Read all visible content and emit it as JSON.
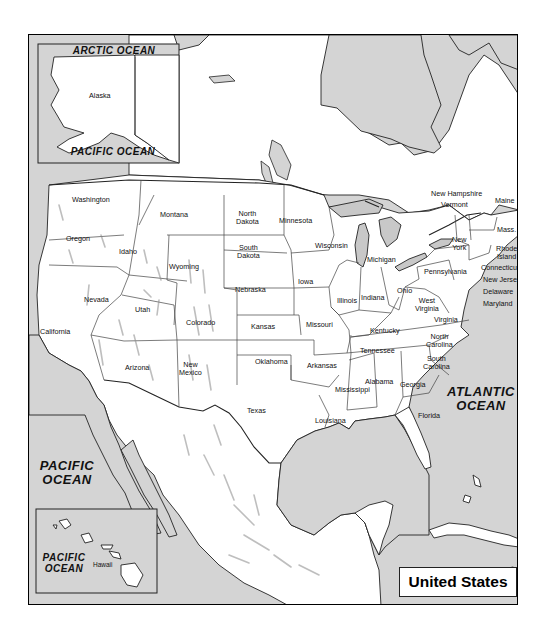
{
  "map": {
    "title": "United States",
    "colors": {
      "water": "#d4d4d4",
      "land": "#ffffff",
      "border": "#222222",
      "lake": "#c8c8c8"
    },
    "oceans": {
      "arctic": "ARCTIC OCEAN",
      "pacific_alaska": "PACIFIC OCEAN",
      "pacific_main_line1": "PACIFIC",
      "pacific_main_line2": "OCEAN",
      "pacific_hawaii_line1": "PACIFIC",
      "pacific_hawaii_line2": "OCEAN",
      "atlantic_line1": "ATLANTIC",
      "atlantic_line2": "OCEAN"
    },
    "insets": {
      "alaska": {
        "label": "Alaska"
      },
      "hawaii": {
        "label": "Hawaii"
      }
    },
    "states": {
      "washington": "Washington",
      "oregon": "Oregon",
      "california": "California",
      "idaho": "Idaho",
      "nevada": "Nevada",
      "montana": "Montana",
      "wyoming": "Wyoming",
      "utah": "Utah",
      "colorado": "Colorado",
      "arizona": "Arizona",
      "new_mexico_1": "New",
      "new_mexico_2": "Mexico",
      "north_dakota_1": "North",
      "north_dakota_2": "Dakota",
      "south_dakota_1": "South",
      "south_dakota_2": "Dakota",
      "nebraska": "Nebraska",
      "kansas": "Kansas",
      "oklahoma": "Oklahoma",
      "texas": "Texas",
      "minnesota": "Minnesota",
      "iowa": "Iowa",
      "missouri": "Missouri",
      "arkansas": "Arkansas",
      "louisiana": "Louisiana",
      "wisconsin": "Wisconsin",
      "illinois": "Illinois",
      "michigan": "Michigan",
      "indiana": "Indiana",
      "ohio": "Ohio",
      "kentucky": "Kentucky",
      "tennessee": "Tennessee",
      "mississippi": "Mississippi",
      "alabama": "Alabama",
      "georgia": "Georgia",
      "florida": "Florida",
      "south_carolina_1": "South",
      "south_carolina_2": "Carolina",
      "north_carolina_1": "North",
      "north_carolina_2": "Carolina",
      "virginia": "Virginia",
      "west_virginia_1": "West",
      "west_virginia_2": "Virginia",
      "pennsylvania": "Pennsylvania",
      "new_york_1": "New",
      "new_york_2": "York",
      "new_hampshire": "New Hampshire",
      "vermont": "Vermont",
      "maine": "Maine",
      "massachusetts": "Mass.",
      "rhode_island_1": "Rhode",
      "rhode_island_2": "Island",
      "connecticut": "Connecticut",
      "new_jersey": "New Jersey",
      "delaware": "Delaware",
      "maryland": "Maryland"
    }
  }
}
